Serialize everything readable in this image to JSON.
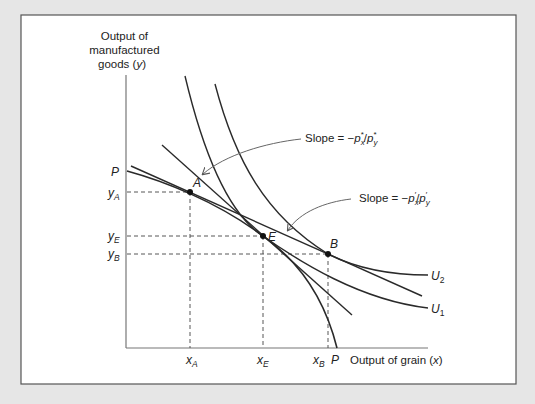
{
  "figure": {
    "background_color": "#e6e6e6",
    "panel_color": "#ffffff",
    "panel_border_color": "#555555",
    "line_color": "#2a2a2a",
    "arrow_color": "#666666"
  },
  "axes": {
    "y_label_lines": [
      "Output of",
      "manufactured",
      "goods ("
    ],
    "y_label_var": "y",
    "y_label_close": ")",
    "x_label_prefix": "Output of grain (",
    "x_label_var": "x",
    "x_label_close": ")"
  },
  "intercepts": {
    "y_axis_P": "P",
    "x_axis_P": "P"
  },
  "ticks": {
    "y": [
      {
        "base": "y",
        "sub": "A"
      },
      {
        "base": "y",
        "sub": "E"
      },
      {
        "base": "y",
        "sub": "B"
      }
    ],
    "x": [
      {
        "base": "x",
        "sub": "A"
      },
      {
        "base": "x",
        "sub": "E"
      },
      {
        "base": "x",
        "sub": "B"
      }
    ]
  },
  "points": {
    "A": "A",
    "E": "E",
    "B": "B"
  },
  "curves": {
    "U1": {
      "base": "U",
      "sub": "1"
    },
    "U2": {
      "base": "U",
      "sub": "2"
    }
  },
  "annotations": {
    "slope_star": {
      "prefix": "Slope = −",
      "num_base": "p",
      "num_sub": "x",
      "num_sup": "*",
      "slash": "/",
      "den_base": "p",
      "den_sub": "y",
      "den_sup": "*"
    },
    "slope_prime": {
      "prefix": "Slope = −",
      "num_base": "p",
      "num_sub": "x",
      "num_sup": "′",
      "slash": "/",
      "den_base": "p",
      "den_sub": "y",
      "den_sup": "′"
    }
  }
}
